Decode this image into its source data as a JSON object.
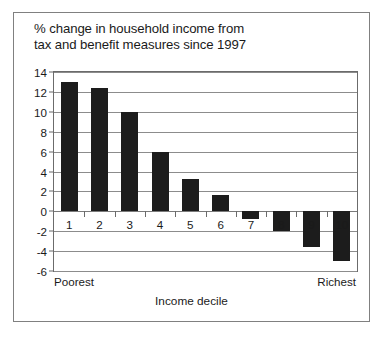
{
  "chart_data": {
    "type": "bar",
    "title": "% change in household income from\ntax and benefit measures since 1997",
    "xlabel": "Income decile",
    "ylabel": "",
    "categories": [
      "1",
      "2",
      "3",
      "4",
      "5",
      "6",
      "7",
      "8",
      "9",
      "10"
    ],
    "values": [
      13.0,
      12.4,
      10.0,
      6.0,
      3.2,
      1.6,
      -0.8,
      -2.0,
      -3.6,
      -5.0
    ],
    "ylim": [
      -6,
      14
    ],
    "yticks": [
      14,
      12,
      10,
      8,
      6,
      4,
      2,
      0,
      -2,
      -4,
      -6
    ],
    "ytick_labels": [
      "14",
      "12",
      "10",
      "8",
      "6",
      "4",
      "2",
      "0",
      "-2",
      "-4",
      "-6"
    ],
    "grid": true,
    "legend_position": "none",
    "bar_color": "#1c1c1c",
    "annotations": {
      "left_end": "Poorest",
      "right_end": "Richest"
    }
  }
}
